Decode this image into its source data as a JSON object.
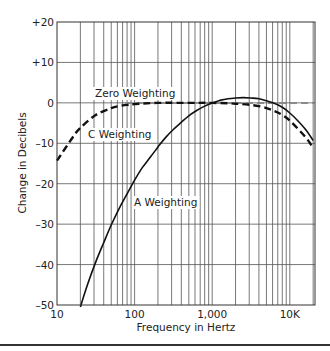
{
  "chart_data": {
    "type": "line",
    "title": "",
    "xlabel": "Frequency in Hertz",
    "ylabel": "Change in Decibels",
    "xscale": "log",
    "xlim": [
      10,
      20000
    ],
    "ylim": [
      -50,
      20
    ],
    "grid": true,
    "x_ticks": [
      {
        "value": 10,
        "label": "10"
      },
      {
        "value": 100,
        "label": "100"
      },
      {
        "value": 1000,
        "label": "1,000"
      },
      {
        "value": 10000,
        "label": "10K"
      }
    ],
    "y_ticks": [
      {
        "value": 20,
        "label": "+20"
      },
      {
        "value": 10,
        "label": "+10"
      },
      {
        "value": 0,
        "label": "0"
      },
      {
        "value": -10,
        "label": "–10"
      },
      {
        "value": -20,
        "label": "–20"
      },
      {
        "value": -30,
        "label": "–30"
      },
      {
        "value": -40,
        "label": "–40"
      },
      {
        "value": -50,
        "label": "–50"
      }
    ],
    "series": [
      {
        "name": "Zero Weighting",
        "style": "dashed-gray",
        "x": [
          10,
          20,
          100,
          1000,
          10000,
          20000
        ],
        "values": [
          0,
          0,
          0,
          0,
          0,
          0
        ]
      },
      {
        "name": "C Weighting",
        "style": "dashed-black",
        "x": [
          10,
          16,
          20,
          31.5,
          50,
          63,
          80,
          100,
          200,
          500,
          1000,
          2000,
          4000,
          6300,
          8000,
          10000,
          16000,
          20000
        ],
        "values": [
          -14.3,
          -8.5,
          -6.2,
          -3.0,
          -1.3,
          -0.8,
          -0.5,
          -0.3,
          0,
          0,
          0,
          -0.2,
          -0.8,
          -2.0,
          -3.0,
          -4.4,
          -8.5,
          -11.2
        ]
      },
      {
        "name": "A Weighting",
        "style": "solid-black",
        "x": [
          20,
          25,
          31.5,
          40,
          50,
          63,
          80,
          100,
          125,
          160,
          200,
          250,
          315,
          400,
          500,
          630,
          800,
          1000,
          1250,
          1600,
          2000,
          2500,
          3150,
          4000,
          5000,
          6300,
          8000,
          10000,
          12500,
          16000,
          20000
        ],
        "values": [
          -50.5,
          -44.7,
          -39.4,
          -34.6,
          -30.2,
          -26.2,
          -22.5,
          -19.1,
          -16.1,
          -13.4,
          -10.9,
          -8.6,
          -6.6,
          -4.8,
          -3.2,
          -1.9,
          -0.8,
          0,
          0.6,
          1.0,
          1.2,
          1.3,
          1.2,
          1.0,
          0.5,
          -0.1,
          -1.1,
          -2.5,
          -4.3,
          -6.6,
          -9.3
        ]
      }
    ],
    "annotations": [
      {
        "text": "Zero Weighting",
        "x": 40,
        "y": 3
      },
      {
        "text": "C Weighting",
        "x": 60,
        "y": -8
      },
      {
        "text": "A Weighting",
        "x": 280,
        "y": -26
      }
    ]
  }
}
